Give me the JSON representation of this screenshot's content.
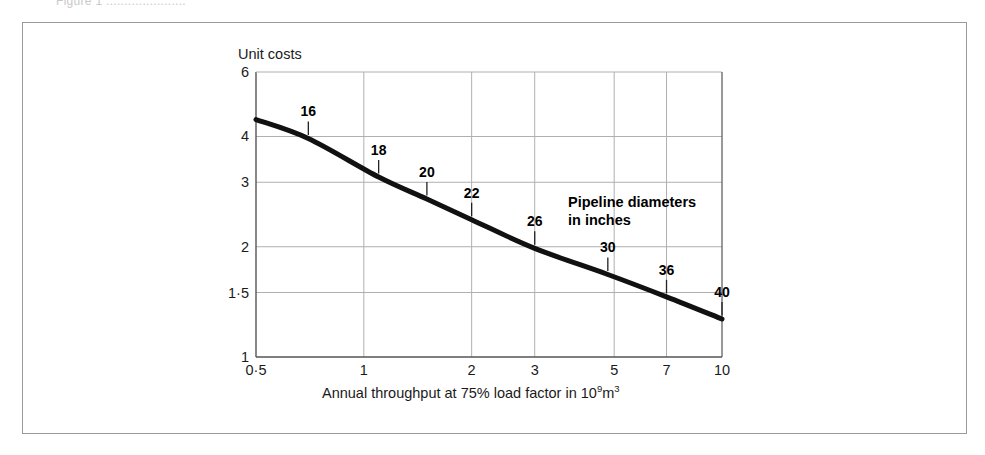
{
  "figure": {
    "caption_remnant": "Figure 1 ......................"
  },
  "chart_data": {
    "type": "line",
    "title": "",
    "xlabel": "Annual throughput at 75% load factor in 10⁹m³",
    "ylabel": "Unit costs",
    "xscale": "log",
    "yscale": "log",
    "xlim": [
      0.5,
      10
    ],
    "ylim": [
      1,
      6
    ],
    "grid": true,
    "legend_position": "inside-upper-right",
    "xticks": [
      0.5,
      1,
      2,
      3,
      5,
      7,
      10
    ],
    "xtick_labels": [
      "0·5",
      "1",
      "2",
      "3",
      "5",
      "7",
      "10"
    ],
    "yticks": [
      1,
      1.5,
      2,
      3,
      4,
      6
    ],
    "ytick_labels": [
      "1",
      "1·5",
      "2",
      "3",
      "4",
      "6"
    ],
    "series": [
      {
        "name": "Unit costs vs annual throughput",
        "x": [
          0.5,
          0.7,
          1.1,
          1.5,
          2.0,
          3.0,
          4.8,
          7.0,
          10.0
        ],
        "y": [
          4.45,
          3.95,
          3.1,
          2.7,
          2.37,
          1.98,
          1.68,
          1.46,
          1.27
        ]
      }
    ],
    "annotations": [
      {
        "label": "16",
        "x": 0.7,
        "y": 3.95
      },
      {
        "label": "18",
        "x": 1.1,
        "y": 3.1
      },
      {
        "label": "20",
        "x": 1.5,
        "y": 2.7
      },
      {
        "label": "22",
        "x": 2.0,
        "y": 2.37
      },
      {
        "label": "26",
        "x": 3.0,
        "y": 1.98
      },
      {
        "label": "30",
        "x": 4.8,
        "y": 1.68
      },
      {
        "label": "36",
        "x": 7.0,
        "y": 1.46
      },
      {
        "label": "40",
        "x": 10.0,
        "y": 1.27
      }
    ],
    "annotation_note_line1": "Pipeline diameters",
    "annotation_note_line2": "in inches",
    "colors": {
      "curve": "#111111",
      "grid": "#b0b0b0",
      "axis": "#555555",
      "text": "#1a1a1a",
      "frame": "#9a9a9a",
      "background": "#ffffff"
    }
  }
}
